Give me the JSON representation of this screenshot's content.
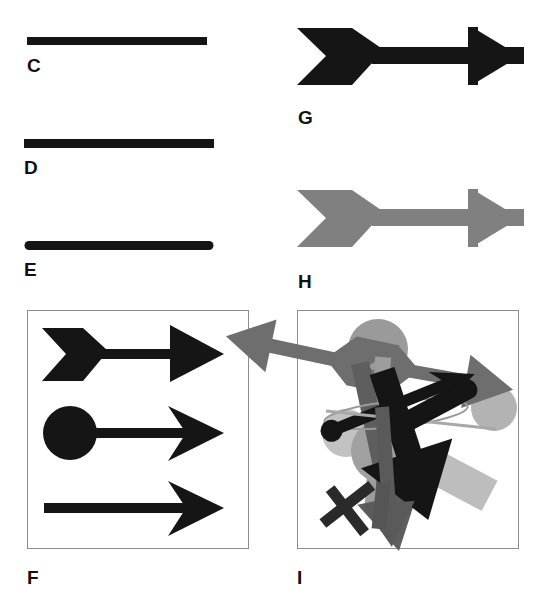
{
  "figure": {
    "caption_letters": [
      "C",
      "D",
      "E",
      "F",
      "G",
      "H",
      "I"
    ],
    "background_color": "#ffffff",
    "ink_black": "#151515",
    "ink_gray": "#808080",
    "ink_light_gray": "#b3b3b3",
    "ink_dark_gray": "#5e5e5e",
    "frame_color": "#8c8c8c",
    "width": 545,
    "height": 601
  },
  "panels": [
    {
      "id": "C",
      "label": "C",
      "description": "horizontal thick black bar, flat square ends",
      "shape": "bar",
      "color": "#151515",
      "x": 27,
      "y": 37,
      "w": 180,
      "h": 8,
      "cap": "butt",
      "label_x": 27,
      "label_y": 56
    },
    {
      "id": "D",
      "label": "D",
      "description": "horizontal thick black bar, flat square ends, wider than C",
      "shape": "bar",
      "color": "#151515",
      "x": 24,
      "y": 139,
      "w": 190,
      "h": 9,
      "cap": "butt",
      "label_x": 24,
      "label_y": 158
    },
    {
      "id": "E",
      "label": "E",
      "description": "horizontal thick black bar with rounded end caps",
      "shape": "bar",
      "color": "#151515",
      "x": 24,
      "y": 241,
      "w": 190,
      "h": 9,
      "cap": "round",
      "label_x": 24,
      "label_y": 260
    },
    {
      "id": "G",
      "label": "G",
      "description": "black arrow with notched fletching tail, thick shaft and solid triangular head",
      "shape": "arrow",
      "color": "#151515",
      "label_x": 298,
      "label_y": 108
    },
    {
      "id": "H",
      "label": "H",
      "description": "gray arrow identical in shape to G, rendered in mid gray halftone",
      "shape": "arrow",
      "color": "#808080",
      "label_x": 298,
      "label_y": 272
    },
    {
      "id": "F",
      "label": "F",
      "description": "framed box containing three black arrows: fletched arrow, ball-tailed barbed arrow, plain barbed arrow",
      "shape": "framed-scene",
      "frame": {
        "x": 27,
        "y": 310,
        "w": 222,
        "h": 239
      },
      "label_x": 27,
      "label_y": 575
    },
    {
      "id": "I",
      "label": "I",
      "description": "framed box containing a dense cluttered pile of overlapping rotated arrows in black, dark gray, mid gray and light gray",
      "shape": "framed-scene",
      "frame": {
        "x": 297,
        "y": 310,
        "w": 222,
        "h": 239
      },
      "label_x": 297,
      "label_y": 575
    }
  ],
  "panel_f_items": [
    {
      "name": "fletched-arrow",
      "color": "#151515"
    },
    {
      "name": "ball-tail-barbed-arrow",
      "color": "#151515"
    },
    {
      "name": "plain-barbed-arrow",
      "color": "#151515"
    }
  ],
  "panel_i_items": [
    {
      "name": "light-gray-circle-right",
      "color": "#b3b3b3"
    },
    {
      "name": "mid-gray-circle-top",
      "color": "#909090"
    },
    {
      "name": "mid-gray-arrow-left",
      "color": "#6e6e6e"
    },
    {
      "name": "mid-gray-arrow-right",
      "color": "#6e6e6e"
    },
    {
      "name": "light-gray-rectangle",
      "color": "#bdbdbd"
    },
    {
      "name": "black-arrow-down",
      "color": "#151515"
    },
    {
      "name": "black-arrow-diagonal",
      "color": "#151515"
    },
    {
      "name": "dark-gray-arrow-down",
      "color": "#5e5e5e"
    },
    {
      "name": "thin-outline-ellipse",
      "color": "#9a9a9a"
    },
    {
      "name": "black-ball-tail-arrow",
      "color": "#151515"
    },
    {
      "name": "black-cross-bar",
      "color": "#2a2a2a"
    }
  ]
}
